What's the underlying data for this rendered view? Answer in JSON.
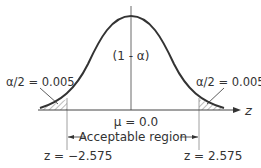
{
  "diagram": {
    "type": "normal-distribution-two-tailed",
    "center_label": "(1 - α)",
    "mean_label": "μ = 0.0",
    "left_tail_label": "α/2 = 0.005",
    "right_tail_label": "α/2 = 0.005",
    "region_label": "Acceptable region",
    "left_critical_label": "z = −2.575",
    "right_critical_label": "z = 2.575",
    "axis_label": "z",
    "colors": {
      "curve": "#333333",
      "axis": "#444444",
      "guide_lines": "#888888",
      "text": "#333333"
    }
  }
}
